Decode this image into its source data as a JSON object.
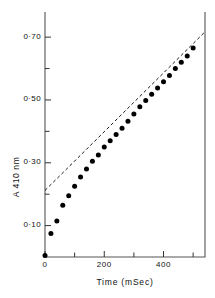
{
  "chart_data": {
    "type": "scatter",
    "title": "",
    "xlabel": "Time  (mSec)",
    "ylabel": "A 410 nm",
    "xlim": [
      0,
      540
    ],
    "ylim": [
      0,
      0.78
    ],
    "grid": false,
    "legend": "none",
    "x_ticks_major": [
      0,
      200,
      400
    ],
    "x_tick_labels": [
      "0",
      "200",
      "400"
    ],
    "x_ticks_minor": [
      100,
      300,
      500
    ],
    "y_ticks_major": [
      0.1,
      0.3,
      0.5,
      0.7
    ],
    "y_tick_labels": [
      "0·10",
      "0·30",
      "0·50",
      "0·70"
    ],
    "y_ticks_minor": [
      0.2,
      0.4,
      0.6
    ],
    "marker": "filled-circle",
    "marker_color": "#000000",
    "series": [
      {
        "name": "A410nm burst kinetics",
        "x": [
          0,
          20,
          40,
          60,
          80,
          100,
          120,
          140,
          160,
          180,
          200,
          220,
          240,
          260,
          280,
          300,
          320,
          340,
          360,
          380,
          400,
          420,
          440,
          460,
          480,
          500
        ],
        "y": [
          0.005,
          0.075,
          0.115,
          0.165,
          0.195,
          0.225,
          0.255,
          0.28,
          0.305,
          0.325,
          0.35,
          0.37,
          0.39,
          0.41,
          0.432,
          0.455,
          0.478,
          0.498,
          0.518,
          0.538,
          0.558,
          0.578,
          0.6,
          0.62,
          0.64,
          0.665
        ]
      }
    ],
    "fit_line": {
      "style": "dashed",
      "color": "#000000",
      "intercept": 0.212,
      "slope_per_msec": 0.000935,
      "x_start": 0,
      "x_end": 540,
      "note": "extrapolated steady-state line"
    }
  }
}
